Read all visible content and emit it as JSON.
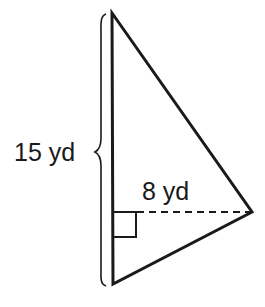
{
  "diagram": {
    "type": "right-triangle-area",
    "shape": "triangle",
    "base_label": "15 yd",
    "height_label": "8 yd",
    "base_value": 15,
    "height_value": 8,
    "unit": "yd",
    "right_angle_marker": true,
    "height_line_style": "dashed",
    "colors": {
      "stroke": "#1a1a1a",
      "background": "#ffffff"
    }
  }
}
